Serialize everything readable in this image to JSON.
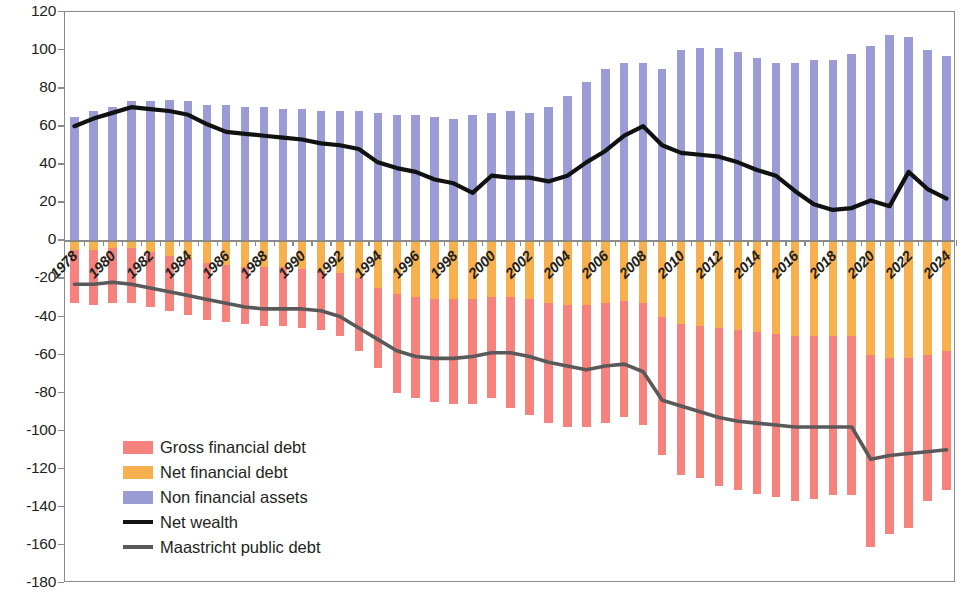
{
  "chart": {
    "type": "bar",
    "title": "",
    "xlabel": "",
    "ylabel": "",
    "note": "Stacked bar chart of general government balance sheet as percent of GDP with two overlaid lines"
  },
  "axis": {
    "y_ticks": [
      "120",
      "100",
      "80",
      "60",
      "40",
      "20",
      "0",
      "-20",
      "-40",
      "-60",
      "-80",
      "-100",
      "-120",
      "-140",
      "-160",
      "-180"
    ],
    "y_min": -180,
    "y_max": 120,
    "y_step": 20,
    "x_tick_labels": [
      "1978",
      "1980",
      "1982",
      "1984",
      "1986",
      "1988",
      "1990",
      "1992",
      "1994",
      "1996",
      "1998",
      "2000",
      "2002",
      "2004",
      "2006",
      "2008",
      "2010",
      "2012",
      "2014",
      "2016",
      "2018",
      "2020",
      "2022",
      "2024"
    ],
    "x_label_interval": 2
  },
  "legend": {
    "items": [
      {
        "label": "Gross financial debt",
        "color": "#F5827D",
        "kind": "swatch"
      },
      {
        "label": "Net financial debt",
        "color": "#F8B04E",
        "kind": "swatch"
      },
      {
        "label": "Non financial assets",
        "color": "#9B9BD6",
        "kind": "swatch"
      },
      {
        "label": "Net wealth",
        "color": "#111111",
        "kind": "line"
      },
      {
        "label": "Maastricht public debt",
        "color": "#595959",
        "kind": "line"
      }
    ]
  },
  "colors": {
    "gross_financial_debt": "#F5827D",
    "net_financial_debt": "#F8B04E",
    "non_financial_assets": "#9B9BD6",
    "net_wealth_line": "#111111",
    "maastricht_line": "#595959",
    "axis": "#8a8a8a",
    "text": "#231f20",
    "background": "#ffffff"
  },
  "chart_data": {
    "type": "bar",
    "title": "",
    "xlabel": "",
    "ylabel": "",
    "ylim": [
      -180,
      120
    ],
    "grid": false,
    "legend_position": "inside-lower-left",
    "stacked": true,
    "categories": [
      "1978",
      "1979",
      "1980",
      "1981",
      "1982",
      "1983",
      "1984",
      "1985",
      "1986",
      "1987",
      "1988",
      "1989",
      "1990",
      "1991",
      "1992",
      "1993",
      "1994",
      "1995",
      "1996",
      "1997",
      "1998",
      "1999",
      "2000",
      "2001",
      "2002",
      "2003",
      "2004",
      "2005",
      "2006",
      "2007",
      "2008",
      "2009",
      "2010",
      "2011",
      "2012",
      "2013",
      "2014",
      "2015",
      "2016",
      "2017",
      "2018",
      "2019",
      "2020",
      "2021",
      "2022",
      "2023",
      "2024"
    ],
    "series": [
      {
        "name": "Non financial assets",
        "color": "#9B9BD6",
        "stack": "positive",
        "values": [
          65,
          68,
          70,
          73,
          73,
          74,
          73,
          71,
          71,
          70,
          70,
          69,
          69,
          68,
          68,
          68,
          67,
          66,
          66,
          65,
          64,
          66,
          67,
          68,
          67,
          70,
          76,
          83,
          90,
          93,
          93,
          90,
          100,
          101,
          101,
          99,
          96,
          93,
          93,
          95,
          95,
          98,
          102,
          108,
          107,
          100,
          97
        ]
      },
      {
        "name": "Net financial debt",
        "color": "#F8B04E",
        "stack": "negative",
        "values": [
          -5,
          -5,
          -4,
          -4,
          -6,
          -8,
          -10,
          -12,
          -13,
          -14,
          -14,
          -14,
          -15,
          -16,
          -17,
          -20,
          -25,
          -28,
          -30,
          -31,
          -31,
          -31,
          -30,
          -30,
          -31,
          -33,
          -34,
          -34,
          -33,
          -32,
          -33,
          -40,
          -44,
          -45,
          -46,
          -47,
          -48,
          -49,
          -50,
          -50,
          -50,
          -50,
          -60,
          -62,
          -62,
          -60,
          -58
        ]
      },
      {
        "name": "Gross financial debt",
        "color": "#F5827D",
        "stack": "negative",
        "note": "Bar extends further down from the bottom of the Net financial debt segment; values listed are the total bottom of bar (net + gross portion)",
        "bar_bottom_values": [
          -33,
          -34,
          -33,
          -33,
          -35,
          -37,
          -39,
          -42,
          -43,
          -44,
          -45,
          -45,
          -46,
          -47,
          -50,
          -58,
          -67,
          -80,
          -83,
          -85,
          -86,
          -86,
          -83,
          -88,
          -92,
          -96,
          -98,
          -98,
          -96,
          -93,
          -97,
          -113,
          -123,
          -125,
          -129,
          -131,
          -133,
          -135,
          -137,
          -136,
          -134,
          -134,
          -161,
          -154,
          -151,
          -137,
          -131
        ]
      }
    ],
    "lines": [
      {
        "name": "Net wealth",
        "color": "#111111",
        "values": [
          60,
          64,
          67,
          70,
          69,
          68,
          66,
          61,
          57,
          56,
          55,
          54,
          53,
          51,
          50,
          48,
          41,
          38,
          36,
          32,
          30,
          25,
          34,
          33,
          33,
          31,
          34,
          41,
          47,
          55,
          60,
          50,
          46,
          45,
          44,
          41,
          37,
          34,
          26,
          19,
          16,
          17,
          21,
          18,
          36,
          27,
          22
        ]
      },
      {
        "name": "Maastricht public debt",
        "color": "#595959",
        "values": [
          -23,
          -23,
          -22,
          -23,
          -25,
          -27,
          -29,
          -31,
          -33,
          -35,
          -36,
          -36,
          -36,
          -37,
          -40,
          -46,
          -52,
          -58,
          -61,
          -62,
          -62,
          -61,
          -59,
          -59,
          -61,
          -64,
          -66,
          -68,
          -66,
          -65,
          -69,
          -84,
          -87,
          -90,
          -93,
          -95,
          -96,
          -97,
          -98,
          -98,
          -98,
          -98,
          -115,
          -113,
          -112,
          -111,
          -110
        ]
      }
    ]
  }
}
